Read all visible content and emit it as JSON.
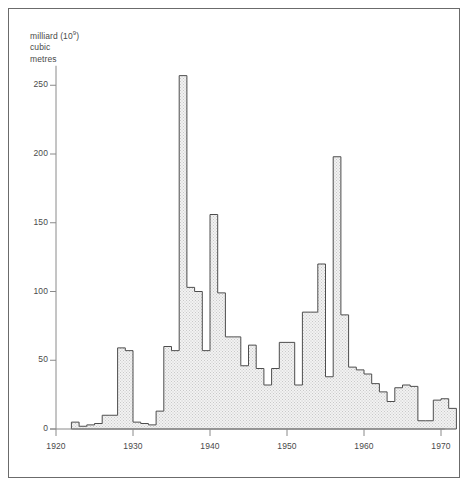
{
  "figure": {
    "unit_label_line1": "milliard (10",
    "unit_label_exp": "9",
    "unit_label_line1_end": ")",
    "unit_label_line2": "cubic",
    "unit_label_line3": "metres",
    "border_color": "#6b6b6b",
    "bar_stroke_color": "#4d4d4d",
    "bar_fill_color": "#e8e8e8",
    "axis_color": "#8a8a8a",
    "text_color": "#4a4a4a",
    "background_color": "#ffffff"
  },
  "chart_data": {
    "type": "bar",
    "title": "",
    "subtitle": "",
    "xlabel": "",
    "ylabel": "milliard (10^9) cubic metres",
    "xlim": [
      1920,
      1972
    ],
    "ylim": [
      0,
      270
    ],
    "ytick_values": [
      0,
      50,
      100,
      150,
      200,
      250
    ],
    "ytick_labels": [
      "0",
      "50",
      "100",
      "150",
      "200",
      "250"
    ],
    "xtick_values": [
      1920,
      1930,
      1940,
      1950,
      1960,
      1970
    ],
    "xtick_labels": [
      "1920",
      "1930",
      "1940",
      "1950",
      "1960",
      "1970"
    ],
    "grid": false,
    "legend": "none",
    "categories": [
      1922,
      1923,
      1924,
      1925,
      1926,
      1927,
      1928,
      1929,
      1930,
      1931,
      1932,
      1933,
      1934,
      1935,
      1936,
      1937,
      1938,
      1939,
      1940,
      1941,
      1942,
      1943,
      1944,
      1945,
      1946,
      1947,
      1948,
      1949,
      1950,
      1951,
      1952,
      1953,
      1954,
      1955,
      1956,
      1957,
      1958,
      1959,
      1960,
      1961,
      1962,
      1963,
      1964,
      1965,
      1966,
      1967,
      1968,
      1969,
      1970,
      1971
    ],
    "values": [
      5,
      2,
      3,
      4,
      10,
      10,
      59,
      57,
      5,
      4,
      3,
      13,
      60,
      57,
      257,
      103,
      100,
      57,
      156,
      99,
      67,
      67,
      46,
      61,
      44,
      32,
      44,
      63,
      63,
      32,
      85,
      85,
      120,
      38,
      198,
      83,
      45,
      43,
      40,
      33,
      27,
      20,
      30,
      32,
      31,
      6,
      6,
      21,
      22,
      15
    ]
  }
}
